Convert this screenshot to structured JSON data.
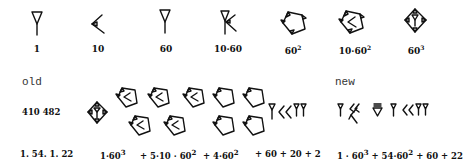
{
  "top_row": {
    "signs": [
      {
        "label": "1",
        "icon": "wedge-vertical"
      },
      {
        "label": "10",
        "icon": "wedge-corner"
      },
      {
        "label": "60",
        "icon": "wedge-vertical"
      },
      {
        "label": "10·60",
        "icon": "wedge-vertical-with-corner"
      },
      {
        "label": "60",
        "sup": "2",
        "icon": "sar-diamond"
      },
      {
        "label": "10·60",
        "sup": "2",
        "icon": "sar-diamond-with-corner"
      },
      {
        "label": "60",
        "sup": "3",
        "icon": "sar-diamond-with-wedge"
      }
    ]
  },
  "old": {
    "heading": "old",
    "number_label": "410 482",
    "sexagesimal": "1. 54. 1. 22",
    "terms": [
      {
        "text": "1·60",
        "sup": "3"
      },
      {
        "text": "+ 5·10 · 60",
        "sup": "2"
      },
      {
        "text": "+ 4·60",
        "sup": "2"
      },
      {
        "text": "+ 60 + 20 + 2",
        "sup": ""
      }
    ]
  },
  "new": {
    "heading": "new",
    "expression": "1 · 60",
    "expression_sup1": "3",
    "expression_mid": " + 54·60",
    "expression_sup2": "2",
    "expression_end": " + 60 + 22"
  }
}
